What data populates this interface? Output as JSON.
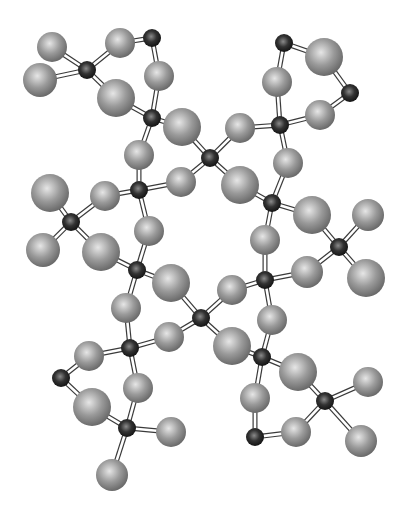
{
  "figure": {
    "kind": "ball-and-stick molecular model",
    "colors": {
      "background": "#ffffff",
      "light_atom_highlight": "#e6e6e6",
      "light_atom_mid": "#9a9a9a",
      "light_atom_edge": "#6a6a6a",
      "dark_atom_highlight": "#8a8a8a",
      "dark_atom_mid": "#333333",
      "dark_atom_edge": "#111111",
      "bond_fill": "#ffffff",
      "bond_stroke": "#3a3a3a"
    },
    "atoms": [
      {
        "id": "d1",
        "type": "dark",
        "x": 87,
        "y": 70
      },
      {
        "id": "d2",
        "type": "dark",
        "x": 152,
        "y": 38
      },
      {
        "id": "d3",
        "type": "dark",
        "x": 152,
        "y": 118
      },
      {
        "id": "d4",
        "type": "dark",
        "x": 139,
        "y": 190
      },
      {
        "id": "d5",
        "type": "dark",
        "x": 71,
        "y": 222
      },
      {
        "id": "d6",
        "type": "dark",
        "x": 137,
        "y": 270
      },
      {
        "id": "d7",
        "type": "dark",
        "x": 130,
        "y": 348
      },
      {
        "id": "d8",
        "type": "dark",
        "x": 61,
        "y": 378
      },
      {
        "id": "d9",
        "type": "dark",
        "x": 127,
        "y": 428
      },
      {
        "id": "d10",
        "type": "dark",
        "x": 210,
        "y": 158
      },
      {
        "id": "d11",
        "type": "dark",
        "x": 201,
        "y": 318
      },
      {
        "id": "d12",
        "type": "dark",
        "x": 280,
        "y": 125
      },
      {
        "id": "d13",
        "type": "dark",
        "x": 272,
        "y": 203
      },
      {
        "id": "d14",
        "type": "dark",
        "x": 350,
        "y": 93
      },
      {
        "id": "d15",
        "type": "dark",
        "x": 284,
        "y": 43
      },
      {
        "id": "d16",
        "type": "dark",
        "x": 339,
        "y": 247
      },
      {
        "id": "d17",
        "type": "dark",
        "x": 265,
        "y": 280
      },
      {
        "id": "d18",
        "type": "dark",
        "x": 262,
        "y": 357
      },
      {
        "id": "d19",
        "type": "dark",
        "x": 325,
        "y": 401
      },
      {
        "id": "d20",
        "type": "dark",
        "x": 255,
        "y": 437
      },
      {
        "id": "l1",
        "type": "light",
        "x": 52,
        "y": 47,
        "r": 15
      },
      {
        "id": "l2",
        "type": "light",
        "x": 40,
        "y": 80,
        "r": 17
      },
      {
        "id": "l3",
        "type": "light",
        "x": 120,
        "y": 43,
        "r": 15
      },
      {
        "id": "l4",
        "type": "light",
        "x": 159,
        "y": 76,
        "r": 15
      },
      {
        "id": "l5",
        "type": "light",
        "x": 116,
        "y": 98,
        "r": 19
      },
      {
        "id": "l6",
        "type": "light",
        "x": 182,
        "y": 127,
        "r": 19
      },
      {
        "id": "l7",
        "type": "light",
        "x": 139,
        "y": 155,
        "r": 15
      },
      {
        "id": "l8",
        "type": "light",
        "x": 50,
        "y": 193,
        "r": 19
      },
      {
        "id": "l9",
        "type": "light",
        "x": 105,
        "y": 196,
        "r": 15
      },
      {
        "id": "l10",
        "type": "light",
        "x": 43,
        "y": 250,
        "r": 17
      },
      {
        "id": "l11",
        "type": "light",
        "x": 101,
        "y": 252,
        "r": 19
      },
      {
        "id": "l12",
        "type": "light",
        "x": 149,
        "y": 231,
        "r": 15
      },
      {
        "id": "l13",
        "type": "light",
        "x": 181,
        "y": 182,
        "r": 15
      },
      {
        "id": "l14",
        "type": "light",
        "x": 171,
        "y": 283,
        "r": 19
      },
      {
        "id": "l15",
        "type": "light",
        "x": 126,
        "y": 308,
        "r": 15
      },
      {
        "id": "l16",
        "type": "light",
        "x": 89,
        "y": 356,
        "r": 15
      },
      {
        "id": "l17",
        "type": "light",
        "x": 169,
        "y": 337,
        "r": 15
      },
      {
        "id": "l18",
        "type": "light",
        "x": 138,
        "y": 388,
        "r": 15
      },
      {
        "id": "l19",
        "type": "light",
        "x": 92,
        "y": 407,
        "r": 19
      },
      {
        "id": "l20",
        "type": "light",
        "x": 171,
        "y": 432,
        "r": 15
      },
      {
        "id": "l21",
        "type": "light",
        "x": 112,
        "y": 475,
        "r": 16
      },
      {
        "id": "l22",
        "type": "light",
        "x": 240,
        "y": 128,
        "r": 15
      },
      {
        "id": "l23",
        "type": "light",
        "x": 240,
        "y": 185,
        "r": 19
      },
      {
        "id": "l24",
        "type": "light",
        "x": 277,
        "y": 82,
        "r": 15
      },
      {
        "id": "l25",
        "type": "light",
        "x": 324,
        "y": 57,
        "r": 19
      },
      {
        "id": "l26",
        "type": "light",
        "x": 320,
        "y": 115,
        "r": 15
      },
      {
        "id": "l27",
        "type": "light",
        "x": 288,
        "y": 163,
        "r": 15
      },
      {
        "id": "l28",
        "type": "light",
        "x": 312,
        "y": 215,
        "r": 19
      },
      {
        "id": "l29",
        "type": "light",
        "x": 368,
        "y": 215,
        "r": 16
      },
      {
        "id": "l30",
        "type": "light",
        "x": 265,
        "y": 240,
        "r": 15
      },
      {
        "id": "l31",
        "type": "light",
        "x": 307,
        "y": 272,
        "r": 16
      },
      {
        "id": "l32",
        "type": "light",
        "x": 366,
        "y": 278,
        "r": 19
      },
      {
        "id": "l33",
        "type": "light",
        "x": 232,
        "y": 290,
        "r": 15
      },
      {
        "id": "l34",
        "type": "light",
        "x": 232,
        "y": 346,
        "r": 19
      },
      {
        "id": "l35",
        "type": "light",
        "x": 272,
        "y": 320,
        "r": 15
      },
      {
        "id": "l36",
        "type": "light",
        "x": 298,
        "y": 372,
        "r": 19
      },
      {
        "id": "l37",
        "type": "light",
        "x": 255,
        "y": 398,
        "r": 15
      },
      {
        "id": "l38",
        "type": "light",
        "x": 368,
        "y": 382,
        "r": 15
      },
      {
        "id": "l39",
        "type": "light",
        "x": 296,
        "y": 432,
        "r": 15
      },
      {
        "id": "l40",
        "type": "light",
        "x": 361,
        "y": 441,
        "r": 16
      }
    ],
    "bonds": [
      [
        "d1",
        "l1"
      ],
      [
        "d1",
        "l2"
      ],
      [
        "d1",
        "l3"
      ],
      [
        "d1",
        "l5"
      ],
      [
        "d2",
        "l3"
      ],
      [
        "d2",
        "l4"
      ],
      [
        "d3",
        "l4"
      ],
      [
        "d3",
        "l5"
      ],
      [
        "d3",
        "l6"
      ],
      [
        "d3",
        "l7"
      ],
      [
        "d4",
        "l7"
      ],
      [
        "d4",
        "l9"
      ],
      [
        "d4",
        "l12"
      ],
      [
        "d4",
        "l13"
      ],
      [
        "d5",
        "l8"
      ],
      [
        "d5",
        "l9"
      ],
      [
        "d5",
        "l10"
      ],
      [
        "d5",
        "l11"
      ],
      [
        "d6",
        "l11"
      ],
      [
        "d6",
        "l12"
      ],
      [
        "d6",
        "l14"
      ],
      [
        "d6",
        "l15"
      ],
      [
        "d7",
        "l15"
      ],
      [
        "d7",
        "l16"
      ],
      [
        "d7",
        "l17"
      ],
      [
        "d7",
        "l18"
      ],
      [
        "d8",
        "l16"
      ],
      [
        "d8",
        "l19"
      ],
      [
        "d9",
        "l18"
      ],
      [
        "d9",
        "l19"
      ],
      [
        "d9",
        "l20"
      ],
      [
        "d9",
        "l21"
      ],
      [
        "d10",
        "l6"
      ],
      [
        "d10",
        "l13"
      ],
      [
        "d10",
        "l22"
      ],
      [
        "d10",
        "l23"
      ],
      [
        "d11",
        "l14"
      ],
      [
        "d11",
        "l17"
      ],
      [
        "d11",
        "l33"
      ],
      [
        "d11",
        "l34"
      ],
      [
        "d12",
        "l22"
      ],
      [
        "d12",
        "l24"
      ],
      [
        "d12",
        "l26"
      ],
      [
        "d12",
        "l27"
      ],
      [
        "d13",
        "l23"
      ],
      [
        "d13",
        "l27"
      ],
      [
        "d13",
        "l28"
      ],
      [
        "d13",
        "l30"
      ],
      [
        "d14",
        "l25"
      ],
      [
        "d14",
        "l26"
      ],
      [
        "d15",
        "l24"
      ],
      [
        "d15",
        "l25"
      ],
      [
        "d16",
        "l28"
      ],
      [
        "d16",
        "l29"
      ],
      [
        "d16",
        "l31"
      ],
      [
        "d16",
        "l32"
      ],
      [
        "d17",
        "l30"
      ],
      [
        "d17",
        "l31"
      ],
      [
        "d17",
        "l33"
      ],
      [
        "d17",
        "l35"
      ],
      [
        "d18",
        "l34"
      ],
      [
        "d18",
        "l35"
      ],
      [
        "d18",
        "l36"
      ],
      [
        "d18",
        "l37"
      ],
      [
        "d19",
        "l36"
      ],
      [
        "d19",
        "l38"
      ],
      [
        "d19",
        "l39"
      ],
      [
        "d19",
        "l40"
      ],
      [
        "d20",
        "l37"
      ],
      [
        "d20",
        "l39"
      ]
    ]
  }
}
